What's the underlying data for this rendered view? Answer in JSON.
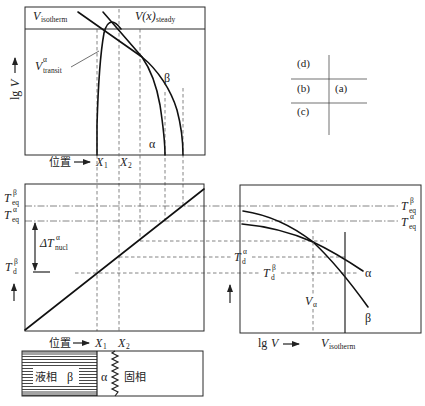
{
  "colors": {
    "background": "#ffffff",
    "line": "#111111",
    "guide_line": "#666666"
  },
  "layout_key": {
    "d": "(d)",
    "b": "(b)",
    "a": "(a)",
    "c": "(c)"
  },
  "panel_d": {
    "v_isotherm": {
      "base": "V",
      "sub": "isotherm"
    },
    "v_steady": {
      "base": "V(x)",
      "sub": "steady"
    },
    "v_transit": {
      "base": "V",
      "sup": "α",
      "sub": "transit"
    },
    "curve_beta": "β",
    "curve_alpha": "α",
    "y_axis": {
      "prefix": "lg",
      "var": "V"
    },
    "x_axis": "位置",
    "x1": {
      "base": "X",
      "sub": "1"
    },
    "x2": {
      "base": "X",
      "sub": "2"
    }
  },
  "panel_b": {
    "t_eq_beta": {
      "base": "T",
      "sup": "β",
      "sub": "eq"
    },
    "t_eq_alpha": {
      "base": "T",
      "sup": "α",
      "sub": "eq"
    },
    "delta_t_nucl": {
      "base": "ΔT",
      "sup": "α",
      "sub": "nucl"
    },
    "t_d_beta": {
      "base": "T",
      "sup": "β",
      "sub": "d"
    },
    "x_axis": "位置",
    "x1": {
      "base": "X",
      "sub": "1"
    },
    "x2": {
      "base": "X",
      "sub": "2"
    }
  },
  "panel_a": {
    "t_eq_beta": {
      "base": "T",
      "sup": "β",
      "sub": "eq"
    },
    "t_eq_alpha": {
      "base": "T",
      "sup": "α",
      "sub": "eq"
    },
    "t_d_alpha": {
      "base": "T",
      "sup": "α",
      "sub": "d"
    },
    "t_d_beta": {
      "base": "T",
      "sup": "β",
      "sub": "d"
    },
    "v_alpha": {
      "base": "V",
      "sub": "α"
    },
    "curve_alpha": "α",
    "curve_beta": "β",
    "x_axis": {
      "prefix": "lg",
      "var": "V"
    },
    "v_isotherm": {
      "base": "V",
      "sub": "isotherm"
    }
  },
  "panel_c": {
    "liquid": "液相",
    "beta": "β",
    "alpha": "α",
    "solid": "固相"
  }
}
